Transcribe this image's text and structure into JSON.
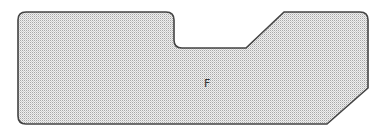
{
  "diagram": {
    "shape": {
      "name": "region-f",
      "label": "F",
      "fill_color": "#bdbdbd",
      "fill_background": "#f2f2f2",
      "fill_pattern": "stipple",
      "stroke_color": "#444444"
    }
  }
}
